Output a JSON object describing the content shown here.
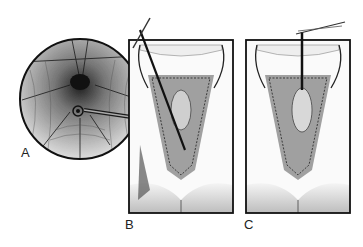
{
  "figure": {
    "type": "surgical-illustration",
    "panels": [
      {
        "id": "A",
        "label": "A",
        "description": "circular magnified inset of perineal operative field with instrument"
      },
      {
        "id": "B",
        "label": "B",
        "description": "rectangular panel, dissection with long forceps/instrument"
      },
      {
        "id": "C",
        "label": "C",
        "description": "rectangular panel, tissue retracted upward with suture"
      }
    ],
    "colors": {
      "ink": "#1a1a1a",
      "shade": "#6b6b6b",
      "light": "#d6d6d6",
      "paper": "#ffffff"
    }
  }
}
